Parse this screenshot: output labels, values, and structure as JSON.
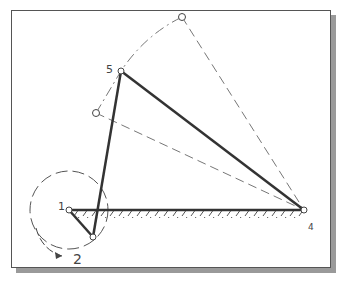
{
  "diagram": {
    "type": "four-bar linkage sketch",
    "labels": {
      "p1": "1",
      "p2": "2",
      "p4": "4",
      "p5": "5"
    },
    "points": {
      "p1": [
        69,
        210
      ],
      "crank_end": [
        93,
        237
      ],
      "p5": [
        121,
        71
      ],
      "p4": [
        304,
        210
      ],
      "ghost_top": [
        182,
        17
      ],
      "ghost_left": [
        96,
        113
      ]
    },
    "colors": {
      "link": "#333333",
      "dashed": "#777777",
      "shadow": "#9a9a9a"
    }
  }
}
